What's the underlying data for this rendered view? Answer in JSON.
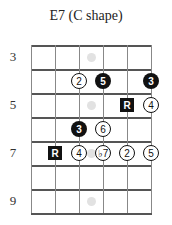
{
  "title": "E7 (C shape)",
  "fret_labels": [
    {
      "label": "3",
      "row": 0
    },
    {
      "label": "5",
      "row": 2
    },
    {
      "label": "7",
      "row": 4
    },
    {
      "label": "9",
      "row": 6
    }
  ],
  "grid": {
    "strings": 6,
    "rows": 7,
    "start_fret": 3
  },
  "inlays": [
    0,
    2,
    4,
    6
  ],
  "markers": [
    {
      "label": "2",
      "row": 1,
      "string": 2,
      "style": "open"
    },
    {
      "label": "5",
      "row": 1,
      "string": 3,
      "style": "filled"
    },
    {
      "label": "3",
      "row": 1,
      "string": 5,
      "style": "filled"
    },
    {
      "label": "R",
      "row": 2,
      "string": 4,
      "style": "root"
    },
    {
      "label": "4",
      "row": 2,
      "string": 5,
      "style": "open"
    },
    {
      "label": "3",
      "row": 3,
      "string": 2,
      "style": "filled"
    },
    {
      "label": "6",
      "row": 3,
      "string": 3,
      "style": "open"
    },
    {
      "label": "R",
      "row": 4,
      "string": 1,
      "style": "root"
    },
    {
      "label": "4",
      "row": 4,
      "string": 2,
      "style": "open"
    },
    {
      "label": "♭7",
      "row": 4,
      "string": 3,
      "style": "open"
    },
    {
      "label": "2",
      "row": 4,
      "string": 4,
      "style": "open"
    },
    {
      "label": "5",
      "row": 4,
      "string": 5,
      "style": "open"
    }
  ]
}
